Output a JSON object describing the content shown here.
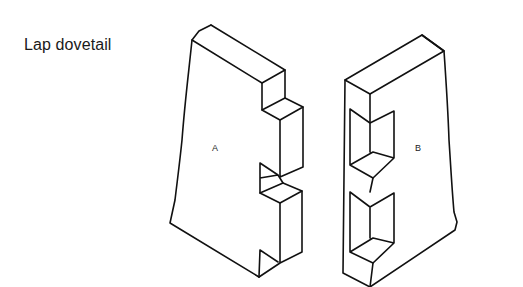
{
  "figure": {
    "title": "Lap dovetail",
    "pieces": [
      {
        "id": "piece-a",
        "label": "A",
        "description": "Tail board with dovetail tails on lapped edge"
      },
      {
        "id": "piece-b",
        "label": "B",
        "description": "Pin board with lapped dovetail sockets"
      }
    ]
  }
}
